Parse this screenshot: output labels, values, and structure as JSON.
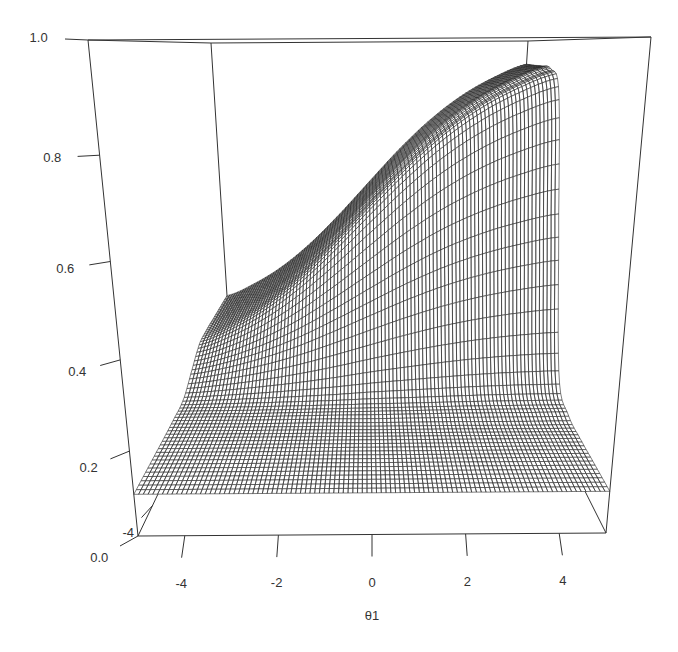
{
  "chart_data": {
    "type": "surface",
    "render": "perspective-wireframe",
    "title": "",
    "xlabel": "θ1",
    "ylabel": "",
    "zlabel": "",
    "x_axis": {
      "range": [
        -5,
        5
      ],
      "ticks": [
        -4,
        -2,
        0,
        2,
        4
      ],
      "tick_labels": [
        "-4",
        "-2",
        "0",
        "2",
        "4"
      ]
    },
    "y_axis": {
      "range": [
        -5,
        5
      ],
      "ticks": [
        -4
      ],
      "tick_labels": [
        "-4"
      ]
    },
    "z_axis": {
      "range": [
        0,
        1
      ],
      "ticks": [
        0.0,
        0.2,
        0.4,
        0.6,
        0.8,
        1.0
      ],
      "tick_labels": [
        "0.0",
        "0.2",
        "0.4",
        "0.6",
        "0.8",
        "1.0"
      ]
    },
    "x": [
      -5,
      -4,
      -3,
      -2,
      -1,
      0,
      1,
      2,
      3,
      4,
      5
    ],
    "y": [
      -5,
      -4,
      -3,
      -2,
      -1,
      0,
      1,
      2,
      3,
      4,
      5
    ],
    "z": [
      [
        0.1,
        0.1,
        0.1,
        0.1,
        0.1,
        0.1,
        0.1,
        0.1,
        0.1,
        0.1,
        0.1
      ],
      [
        0.1,
        0.1,
        0.1,
        0.1,
        0.1,
        0.1,
        0.1,
        0.1,
        0.1,
        0.1,
        0.1
      ],
      [
        0.1,
        0.1,
        0.1,
        0.1,
        0.1,
        0.1,
        0.1,
        0.1,
        0.1,
        0.1,
        0.1
      ],
      [
        0.101,
        0.101,
        0.101,
        0.102,
        0.103,
        0.103,
        0.104,
        0.105,
        0.105,
        0.105,
        0.106
      ],
      [
        0.106,
        0.11,
        0.115,
        0.121,
        0.128,
        0.137,
        0.144,
        0.151,
        0.157,
        0.161,
        0.163
      ],
      [
        0.143,
        0.165,
        0.197,
        0.238,
        0.288,
        0.341,
        0.393,
        0.438,
        0.473,
        0.499,
        0.517
      ],
      [
        0.179,
        0.22,
        0.279,
        0.355,
        0.447,
        0.546,
        0.642,
        0.725,
        0.79,
        0.838,
        0.871
      ],
      [
        0.185,
        0.229,
        0.292,
        0.374,
        0.473,
        0.579,
        0.682,
        0.771,
        0.842,
        0.893,
        0.929
      ],
      [
        0.185,
        0.23,
        0.293,
        0.376,
        0.475,
        0.582,
        0.686,
        0.776,
        0.846,
        0.898,
        0.934
      ],
      [
        0.185,
        0.23,
        0.293,
        0.376,
        0.475,
        0.582,
        0.686,
        0.776,
        0.847,
        0.899,
        0.934
      ],
      [
        0.185,
        0.23,
        0.293,
        0.376,
        0.475,
        0.582,
        0.686,
        0.776,
        0.847,
        0.899,
        0.935
      ]
    ],
    "grid": false,
    "legend": null,
    "view": "perspective box, viewed from the θ2 = -5 side with slight elevation",
    "style": {
      "line_color": "#333333",
      "mesh_color": "#262626",
      "surface_fill": "#ffffff",
      "background": "#ffffff"
    }
  }
}
